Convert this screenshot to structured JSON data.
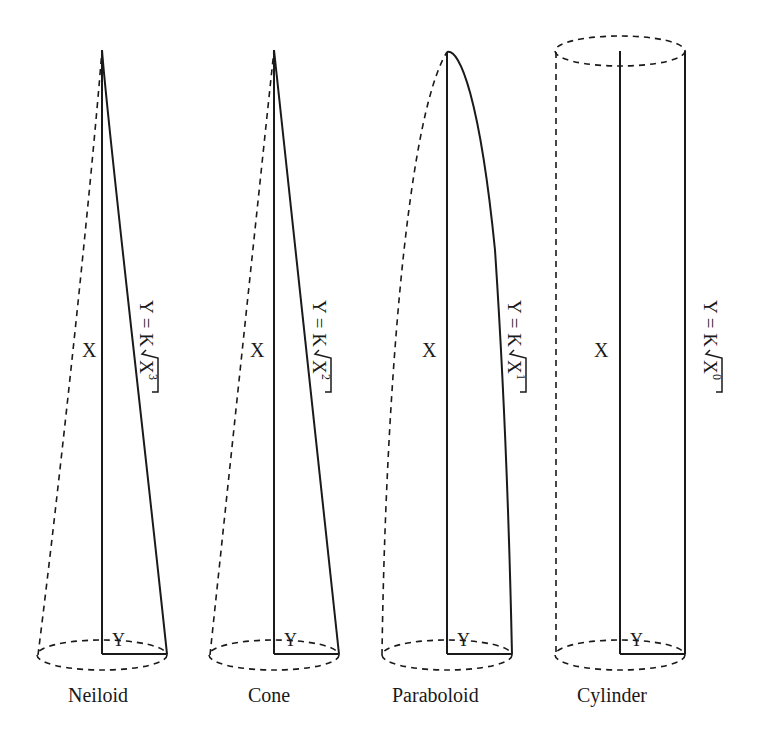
{
  "figure": {
    "shapes": [
      {
        "name": "Neiloid",
        "x_label": "X",
        "y_label": "Y",
        "formula_prefix": "Y = K",
        "formula_radicand": "X",
        "formula_exponent": "3"
      },
      {
        "name": "Cone",
        "x_label": "X",
        "y_label": "Y",
        "formula_prefix": "Y = K",
        "formula_radicand": "X",
        "formula_exponent": "2"
      },
      {
        "name": "Paraboloid",
        "x_label": "X",
        "y_label": "Y",
        "formula_prefix": "Y = K",
        "formula_radicand": "X",
        "formula_exponent": "1"
      },
      {
        "name": "Cylinder",
        "x_label": "X",
        "y_label": "Y",
        "formula_prefix": "Y = K",
        "formula_radicand": "X",
        "formula_exponent": "0"
      }
    ],
    "colors": {
      "line": "#1a1a1a",
      "background": "#ffffff"
    }
  }
}
